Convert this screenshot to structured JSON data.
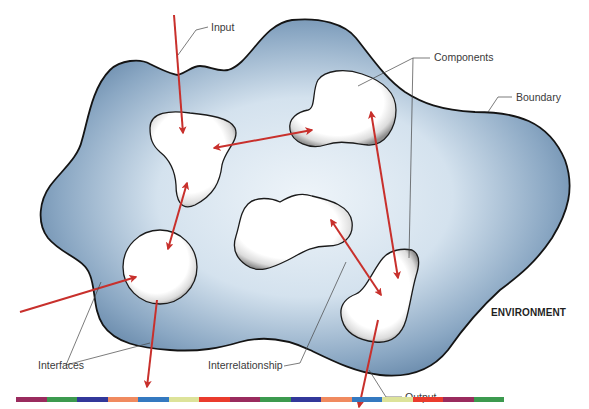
{
  "diagram": {
    "labels": {
      "input": "Input",
      "components": "Components",
      "boundary": "Boundary",
      "environment": "ENVIRONMENT",
      "interfaces": "Interfaces",
      "interrelationship": "Interrelationship",
      "output": "Output"
    },
    "colors": {
      "system_fill_dark": "#4f7499",
      "system_fill_light": "#e6eef5",
      "outline": "#141414",
      "arrow": "#c8302c",
      "component_fill": "#ffffff"
    },
    "color_bar": [
      "#9a2b5e",
      "#3c9a4f",
      "#32389a",
      "#f08a5f",
      "#3479c0",
      "#dde39a",
      "#ea3b2d",
      "#9a2b5e",
      "#3c9a4f",
      "#32389a",
      "#f08a5f",
      "#3479c0",
      "#dde39a",
      "#ea3b2d",
      "#9a2b5e",
      "#3c9a4f"
    ]
  }
}
